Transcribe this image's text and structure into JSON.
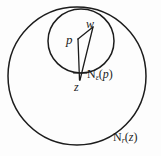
{
  "figure": {
    "kind": "math-diagram",
    "background_color": "#fdfdfd",
    "stroke_color": "#1c1c1c",
    "points": [
      {
        "id": "w",
        "label": "w",
        "x": 93,
        "y": 27
      },
      {
        "id": "p",
        "label": "p",
        "x": 78,
        "y": 39
      },
      {
        "id": "z",
        "label": "z",
        "x": 80,
        "y": 80
      }
    ],
    "circles": [
      {
        "id": "outer",
        "label_id": "n_r_z",
        "cx": 77,
        "cy": 76,
        "rx": 69,
        "ry": 69
      },
      {
        "id": "inner",
        "label_id": "n_eps_p",
        "cx": 81,
        "cy": 41,
        "rx": 33,
        "ry": 32
      }
    ],
    "segments": [
      {
        "id": "p-w",
        "from": "p",
        "to": "w"
      },
      {
        "id": "w-z",
        "from": "w",
        "to": "z"
      },
      {
        "id": "p-z",
        "from": "p",
        "to": "z"
      }
    ],
    "labels": {
      "w": "w",
      "p": "p",
      "z": "z",
      "n_eps_p": {
        "base": "N",
        "sub": "ε",
        "open": "(",
        "arg": "p",
        "close": ")"
      },
      "n_r_z": {
        "base": "N",
        "sub": "r",
        "open": "(",
        "arg": "z",
        "close": ")"
      }
    }
  }
}
